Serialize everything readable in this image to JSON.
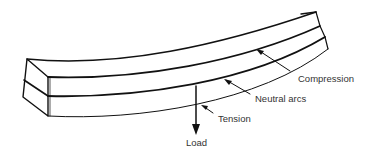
{
  "diagram": {
    "labels": {
      "compression": "Compression",
      "neutral": "Neutral arcs",
      "tension": "Tension",
      "load": "Load"
    },
    "colors": {
      "stroke": "#111111",
      "text": "#333333",
      "background": "#ffffff"
    }
  }
}
